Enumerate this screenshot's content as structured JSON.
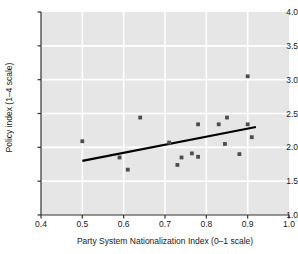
{
  "chart_data": {
    "type": "scatter",
    "title": "",
    "xlabel": "Party System Nationalization Index (0–1 scale)",
    "ylabel": "Policy index (1–4 scale)",
    "xlim": [
      0.4,
      1.0
    ],
    "ylim": [
      1.0,
      4.0
    ],
    "xticks": [
      "0.4",
      "0.5",
      "0.6",
      "0.7",
      "0.8",
      "0.9",
      "1.0"
    ],
    "xtick_values": [
      0.4,
      0.5,
      0.6,
      0.7,
      0.8,
      0.9,
      1.0
    ],
    "yticks": [
      "1.0",
      "1.5",
      "2.0",
      "2.5",
      "3.0",
      "3.5",
      "4.0"
    ],
    "ytick_values": [
      1.0,
      1.5,
      2.0,
      2.5,
      3.0,
      3.5,
      4.0
    ],
    "grid": true,
    "legend": "none",
    "panel_color": "#e6e6e6",
    "grid_color": "#ffffff",
    "marker_color": "#4d4d4d",
    "line_color": "#000000",
    "points": [
      {
        "x": 0.5,
        "y": 2.09
      },
      {
        "x": 0.59,
        "y": 1.85
      },
      {
        "x": 0.61,
        "y": 1.67
      },
      {
        "x": 0.64,
        "y": 2.44
      },
      {
        "x": 0.71,
        "y": 2.07
      },
      {
        "x": 0.73,
        "y": 1.74
      },
      {
        "x": 0.74,
        "y": 1.85
      },
      {
        "x": 0.765,
        "y": 1.91
      },
      {
        "x": 0.78,
        "y": 1.86
      },
      {
        "x": 0.78,
        "y": 2.34
      },
      {
        "x": 0.83,
        "y": 2.34
      },
      {
        "x": 0.845,
        "y": 2.05
      },
      {
        "x": 0.85,
        "y": 2.44
      },
      {
        "x": 0.88,
        "y": 1.9
      },
      {
        "x": 0.9,
        "y": 3.05
      },
      {
        "x": 0.9,
        "y": 2.34
      },
      {
        "x": 0.91,
        "y": 2.15
      }
    ],
    "trend_line": {
      "name": "linear fit",
      "x_start": 0.5,
      "y_start": 1.8,
      "x_end": 0.92,
      "y_end": 2.3
    }
  }
}
